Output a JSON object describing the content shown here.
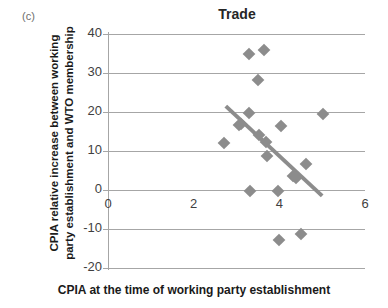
{
  "figure": {
    "panel_label": "(c)",
    "title": "Trade",
    "x_axis_title": "CPIA at the time of working party establishment",
    "y_axis_title": "CPIA relative increase between working party establishment and WTO membership"
  },
  "chart_data": {
    "type": "scatter",
    "title": "Trade",
    "xlabel": "CPIA at the time of working party establishment",
    "ylabel": "CPIA relative increase between working party establishment and WTO membership",
    "xlim": [
      0,
      6
    ],
    "ylim": [
      -20,
      40
    ],
    "xticks": [
      0,
      2,
      4,
      6
    ],
    "yticks": [
      -20,
      -10,
      0,
      10,
      20,
      30,
      40
    ],
    "xtick_labels": [
      "0",
      "2",
      "4",
      "6"
    ],
    "ytick_labels": [
      "40",
      "30",
      "20",
      "10",
      "0",
      "-10",
      "-20"
    ],
    "grid": "horizontal",
    "legend": "none",
    "marker": "diamond",
    "marker_color": "#8c8c8c",
    "points": [
      {
        "x": 2.7,
        "y": 12.0
      },
      {
        "x": 3.05,
        "y": 16.6
      },
      {
        "x": 3.1,
        "y": 17.0
      },
      {
        "x": 3.3,
        "y": 35.0
      },
      {
        "x": 3.3,
        "y": 19.7
      },
      {
        "x": 3.32,
        "y": -0.3
      },
      {
        "x": 3.5,
        "y": 28.3
      },
      {
        "x": 3.52,
        "y": 14.0
      },
      {
        "x": 3.65,
        "y": 36.0
      },
      {
        "x": 3.7,
        "y": 12.2
      },
      {
        "x": 3.72,
        "y": 8.6
      },
      {
        "x": 3.98,
        "y": -0.3
      },
      {
        "x": 4.0,
        "y": -12.8
      },
      {
        "x": 4.05,
        "y": 16.4
      },
      {
        "x": 4.32,
        "y": 3.6
      },
      {
        "x": 4.38,
        "y": 3.2
      },
      {
        "x": 4.5,
        "y": -11.3
      },
      {
        "x": 4.62,
        "y": 6.7
      },
      {
        "x": 5.02,
        "y": 19.5
      }
    ],
    "trendline": {
      "type": "linear",
      "color": "#8c8c8c",
      "x_start": 2.75,
      "y_start": 21.5,
      "x_end": 5.0,
      "y_end": -1.5
    }
  },
  "colors": {
    "marker": "#8c8c8c",
    "trendline": "#8c8c8c",
    "grid": "#a6a6a6",
    "axis": "#a6a6a6",
    "title_text": "#262626",
    "label_text": "#1a1a1a",
    "tick_text": "#3f3f3f",
    "panel_text": "#6d6d6d",
    "background": "#ffffff"
  }
}
